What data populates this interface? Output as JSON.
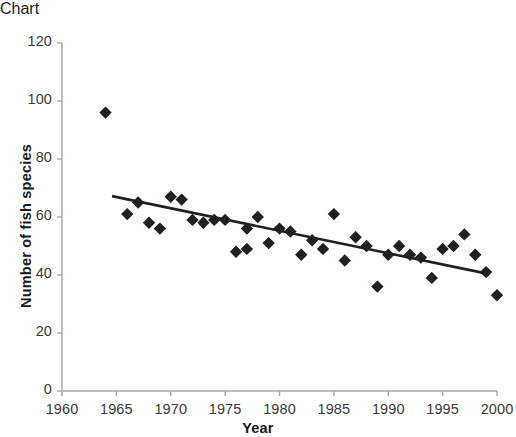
{
  "chart_data": {
    "type": "scatter",
    "title": "",
    "xlabel": "Year",
    "ylabel": "Number of fish species",
    "xlim": [
      1960,
      2000
    ],
    "ylim": [
      0,
      120
    ],
    "xticks": [
      1960,
      1965,
      1970,
      1975,
      1980,
      1985,
      1990,
      1995,
      2000
    ],
    "yticks": [
      0,
      20,
      40,
      60,
      80,
      100,
      120
    ],
    "grid": false,
    "legend": null,
    "marker": "diamond",
    "marker_color": "#231f20",
    "line_color": "#231f20",
    "axis_color": "#a6a6a6",
    "background": "#ffffff",
    "points": [
      {
        "x": 1964,
        "y": 96
      },
      {
        "x": 1966,
        "y": 61
      },
      {
        "x": 1967,
        "y": 65
      },
      {
        "x": 1968,
        "y": 58
      },
      {
        "x": 1969,
        "y": 56
      },
      {
        "x": 1970,
        "y": 67
      },
      {
        "x": 1971,
        "y": 66
      },
      {
        "x": 1972,
        "y": 59
      },
      {
        "x": 1973,
        "y": 58
      },
      {
        "x": 1974,
        "y": 59
      },
      {
        "x": 1975,
        "y": 59
      },
      {
        "x": 1976,
        "y": 48
      },
      {
        "x": 1977,
        "y": 56
      },
      {
        "x": 1977,
        "y": 49
      },
      {
        "x": 1978,
        "y": 60
      },
      {
        "x": 1979,
        "y": 51
      },
      {
        "x": 1980,
        "y": 56
      },
      {
        "x": 1981,
        "y": 55
      },
      {
        "x": 1982,
        "y": 47
      },
      {
        "x": 1983,
        "y": 52
      },
      {
        "x": 1984,
        "y": 49
      },
      {
        "x": 1985,
        "y": 61
      },
      {
        "x": 1986,
        "y": 45
      },
      {
        "x": 1987,
        "y": 53
      },
      {
        "x": 1988,
        "y": 50
      },
      {
        "x": 1989,
        "y": 36
      },
      {
        "x": 1990,
        "y": 47
      },
      {
        "x": 1991,
        "y": 50
      },
      {
        "x": 1992,
        "y": 47
      },
      {
        "x": 1993,
        "y": 46
      },
      {
        "x": 1994,
        "y": 39
      },
      {
        "x": 1995,
        "y": 49
      },
      {
        "x": 1996,
        "y": 50
      },
      {
        "x": 1997,
        "y": 54
      },
      {
        "x": 1998,
        "y": 47
      },
      {
        "x": 1999,
        "y": 41
      },
      {
        "x": 2000,
        "y": 33
      }
    ],
    "trendline": {
      "x0": 1964.6,
      "y0": 67.2,
      "x1": 1999.3,
      "y1": 40.3
    }
  },
  "axes": {
    "x_tick_labels": [
      "1960",
      "1965",
      "1970",
      "1975",
      "1980",
      "1985",
      "1990",
      "1995",
      "2000"
    ],
    "y_tick_labels": [
      "0",
      "20",
      "40",
      "60",
      "80",
      "100",
      "120"
    ],
    "x_axis_title": "Year",
    "y_axis_title": "Number of fish species"
  }
}
